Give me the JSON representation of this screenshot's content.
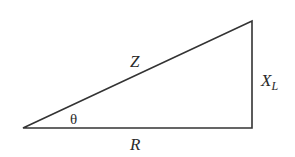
{
  "diagram": {
    "type": "impedance-triangle",
    "colors": {
      "background": "#ffffff",
      "stroke": "#333333",
      "text": "#2a2a2a"
    },
    "vertices": {
      "origin": [
        23,
        128
      ],
      "right_angle": [
        252,
        128
      ],
      "apex": [
        252,
        21
      ]
    },
    "labels": {
      "hypotenuse": "Z",
      "angle": "θ",
      "adjacent": "R",
      "opposite_main": "X",
      "opposite_sub": "L"
    }
  }
}
